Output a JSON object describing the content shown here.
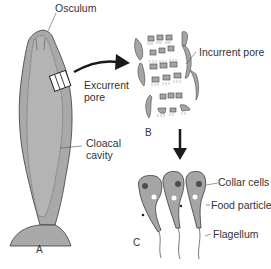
{
  "diagram": {
    "colors": {
      "body_fill": "#a9a9a9",
      "cavity_fill": "#b4b4b4",
      "outline": "#3a3a3a",
      "arrow": "#1a1a1a",
      "text": "#333333"
    },
    "panel_a": {
      "letter": "A",
      "labels": {
        "osculum": "Osculum",
        "excurrent_pore_line1": "Excurrent",
        "excurrent_pore_line2": "pore",
        "cloacal_cavity_line1": "Cloacal",
        "cloacal_cavity_line2": "cavity"
      }
    },
    "panel_b": {
      "letter": "B",
      "labels": {
        "incurrent_pore": "Incurrent pore"
      }
    },
    "panel_c": {
      "letter": "C",
      "labels": {
        "collar_cells": "Collar cells",
        "food_particle": "Food particle",
        "flagellum": "Flagellum"
      }
    }
  }
}
